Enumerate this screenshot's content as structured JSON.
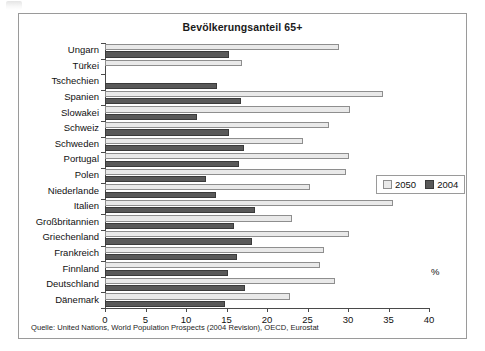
{
  "figure": {
    "title": "Bevölkerungsanteil 65+",
    "source_note": "Quelle: United Nations, World Population Prospects (2004 Revision), OECD, Eurostat",
    "percent_symbol": "%",
    "frame_color": "#9a9a9a"
  },
  "legend": {
    "position": "right-middle",
    "entries": [
      {
        "label": "2050",
        "color": "#e9e9e9"
      },
      {
        "label": "2004",
        "color": "#595959"
      }
    ]
  },
  "chart_data": {
    "type": "bar",
    "orientation": "horizontal",
    "title": "Bevölkerungsanteil 65+",
    "xlabel": "%",
    "ylabel": "",
    "xlim": [
      0,
      40
    ],
    "xticks": [
      0,
      5,
      10,
      15,
      20,
      25,
      30,
      35,
      40
    ],
    "grid": false,
    "categories": [
      "Ungarn",
      "Türkei",
      "Tschechien",
      "Spanien",
      "Slowakei",
      "Schweiz",
      "Schweden",
      "Portugal",
      "Polen",
      "Niederlande",
      "Italien",
      "Großbritannien",
      "Griechenland",
      "Frankreich",
      "Finnland",
      "Deutschland",
      "Dänemark"
    ],
    "series": [
      {
        "name": "2050",
        "color": "#e9e9e9",
        "values": [
          28.9,
          16.9,
          null,
          34.3,
          30.3,
          27.6,
          24.5,
          30.1,
          29.7,
          25.3,
          35.5,
          23.1,
          30.1,
          27.0,
          26.5,
          28.4,
          22.9
        ]
      },
      {
        "name": "2004",
        "color": "#595959",
        "values": [
          15.3,
          null,
          13.8,
          16.8,
          11.4,
          15.3,
          17.2,
          16.6,
          12.5,
          13.7,
          18.5,
          15.9,
          18.1,
          16.3,
          15.2,
          17.3,
          14.8
        ]
      }
    ]
  }
}
